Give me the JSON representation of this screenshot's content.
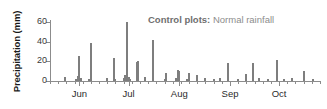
{
  "chart_data": {
    "type": "bar",
    "title": "",
    "xlabel": "",
    "ylabel": "Precipitation (mm)",
    "ylim": [
      0,
      62
    ],
    "yticks": [
      0,
      20,
      40,
      60
    ],
    "ytick_labels": [
      "0",
      "20",
      "40",
      "60"
    ],
    "xlim": [
      0,
      165
    ],
    "xtick_labels": [
      "Jun",
      "Jul",
      "Aug",
      "Sep",
      "Oct"
    ],
    "xtick_positions": [
      18,
      48,
      79,
      110,
      140
    ],
    "grid": false,
    "legend_position": "top-right",
    "bar_color": "#7e7e7e",
    "axis_color": "#8c8c8c",
    "x_unit": "day of season (1 May = 0)",
    "x_values": [
      9,
      16,
      17,
      18,
      19,
      24,
      25,
      35,
      39,
      40,
      45,
      46,
      47,
      48,
      49,
      53,
      54,
      58,
      63,
      70,
      71,
      77,
      78,
      79,
      84,
      85,
      90,
      95,
      100,
      104,
      109,
      115,
      120,
      124,
      128,
      133,
      139,
      143,
      148,
      155,
      161
    ],
    "values": [
      4,
      2,
      5,
      25,
      3,
      2,
      39,
      3,
      23,
      2,
      3,
      6,
      60,
      4,
      2,
      19,
      20,
      4,
      42,
      2,
      8,
      3,
      11,
      10,
      2,
      8,
      6,
      3,
      2,
      3,
      18,
      2,
      7,
      18,
      3,
      2,
      21,
      2,
      3,
      10,
      2
    ],
    "series_name": "Precipitation"
  },
  "annotation": {
    "bold_text": "Control plots:",
    "normal_text": "Normal rainfall"
  }
}
